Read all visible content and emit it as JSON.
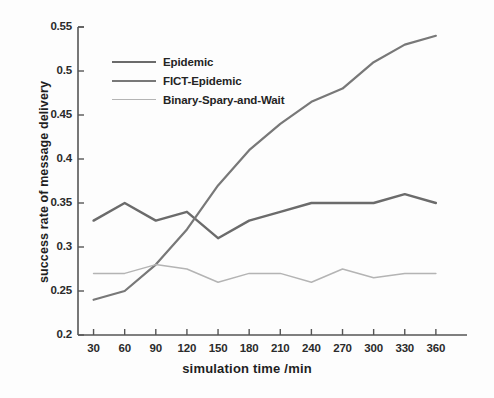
{
  "chart_data": {
    "type": "line",
    "title": "",
    "xlabel": "simulation time  /min",
    "ylabel": "success rate of message delivery",
    "x": [
      30,
      60,
      90,
      120,
      150,
      180,
      210,
      240,
      270,
      300,
      330,
      360
    ],
    "xtick_labels": [
      "30",
      "60",
      "90",
      "120",
      "150",
      "180",
      "210",
      "240",
      "270",
      "300",
      "330",
      "360"
    ],
    "ytick_labels": [
      "0.2",
      "0.25",
      "0.3",
      "0.35",
      "0.4",
      "0.45",
      "0.5",
      "0.55"
    ],
    "yticks": [
      0.2,
      0.25,
      0.3,
      0.35,
      0.4,
      0.45,
      0.5,
      0.55
    ],
    "xlim": [
      15,
      390
    ],
    "ylim": [
      0.2,
      0.55
    ],
    "grid": false,
    "legend_position": "upper-left-inside",
    "series": [
      {
        "name": "Epidemic",
        "color": "#6b6b6b",
        "width": 2.4,
        "values": [
          0.33,
          0.35,
          0.33,
          0.34,
          0.31,
          0.33,
          0.34,
          0.35,
          0.35,
          0.35,
          0.36,
          0.35
        ]
      },
      {
        "name": "FICT-Epidemic",
        "color": "#787878",
        "width": 2.2,
        "values": [
          0.24,
          0.25,
          0.28,
          0.32,
          0.37,
          0.41,
          0.44,
          0.465,
          0.48,
          0.51,
          0.53,
          0.54
        ]
      },
      {
        "name": "Binary-Spary-and-Wait",
        "color": "#b4b4b4",
        "width": 1.5,
        "values": [
          0.27,
          0.27,
          0.28,
          0.275,
          0.26,
          0.27,
          0.27,
          0.26,
          0.275,
          0.265,
          0.27,
          0.27
        ]
      }
    ]
  },
  "axis": {
    "line_color": "#555555"
  },
  "legend": {
    "items": [
      {
        "label": "Epidemic"
      },
      {
        "label": "FICT-Epidemic"
      },
      {
        "label": "Binary-Spary-and-Wait"
      }
    ]
  }
}
